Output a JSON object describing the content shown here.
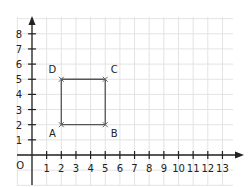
{
  "diagram": {
    "type": "coordinate-plane",
    "origin_label": "O",
    "x_ticks": [
      "1",
      "2",
      "3",
      "4",
      "5",
      "6",
      "7",
      "8",
      "9",
      "10",
      "11",
      "12",
      "13"
    ],
    "y_ticks": [
      "1",
      "2",
      "3",
      "4",
      "5",
      "6",
      "7",
      "8"
    ],
    "points": [
      {
        "label": "A",
        "x": 2,
        "y": 2
      },
      {
        "label": "B",
        "x": 5,
        "y": 2
      },
      {
        "label": "C",
        "x": 5,
        "y": 5
      },
      {
        "label": "D",
        "x": 2,
        "y": 5
      }
    ],
    "shape": "square ABCD",
    "colors": {
      "grid": "#e3e3e3",
      "axis": "#222222",
      "shape": "#555555"
    }
  }
}
